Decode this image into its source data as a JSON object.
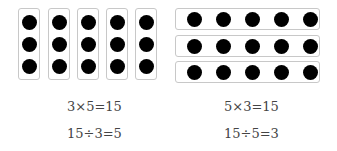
{
  "left_group": {
    "columns": 5,
    "dots_per_column": 3,
    "equations": [
      "3×5=15",
      "15÷3=5"
    ]
  },
  "right_group": {
    "rows": 3,
    "dots_per_row": 5,
    "equations": [
      "5×3=15",
      "15÷5=3"
    ]
  }
}
